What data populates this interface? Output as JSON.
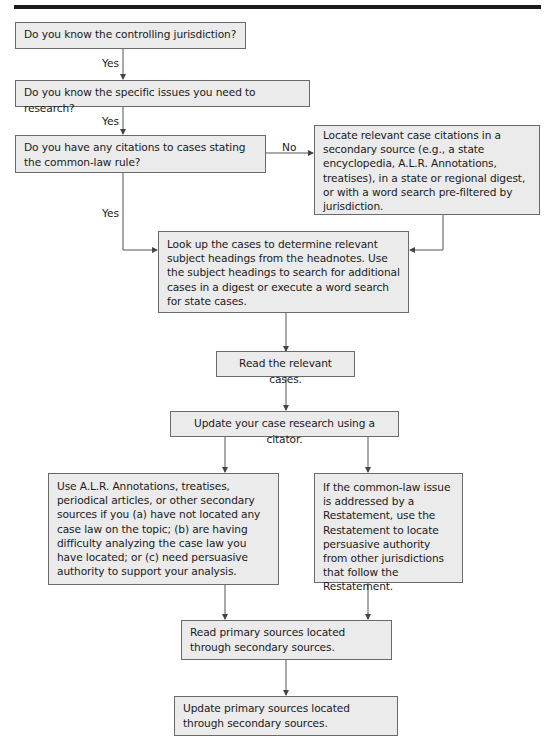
{
  "flowchart": {
    "nodes": [
      {
        "id": "q_jurisdiction",
        "text": "Do you know the controlling jurisdiction?"
      },
      {
        "id": "q_issues",
        "text": "Do you know the specific issues you need to research?"
      },
      {
        "id": "q_citations",
        "text": "Do you have any citations to cases stating the common-law rule?"
      },
      {
        "id": "locate_citations",
        "text": "Locate relevant case citations in a secondary source (e.g., a state encyclopedia, A.L.R. Annotations, treatises), in a state or regional digest, or with a word search pre-filtered by jurisdiction."
      },
      {
        "id": "look_up_cases",
        "text": "Look up the cases to determine relevant subject headings from the headnotes. Use the subject headings to search for additional cases in a digest or execute a word search for state cases."
      },
      {
        "id": "read_cases",
        "text": "Read the relevant cases."
      },
      {
        "id": "update_citator",
        "text": "Update your case research using a citator."
      },
      {
        "id": "use_secondary",
        "text": "Use A.L.R. Annotations, treatises, periodical articles, or other secondary sources if you (a) have not located any case law on the topic; (b) are having difficulty analyzing the case law you have located; or (c) need persuasive authority to support your analysis."
      },
      {
        "id": "restatement",
        "text": "If the common-law issue is addressed by a Restatement, use the Restatement to locate persuasive authority from other jurisdictions that follow the Restatement."
      },
      {
        "id": "read_primary",
        "text": "Read primary sources located through secondary sources."
      },
      {
        "id": "update_primary",
        "text": "Update primary sources located through secondary sources."
      }
    ],
    "edge_labels": {
      "yes_1": "Yes",
      "yes_2": "Yes",
      "yes_3": "Yes",
      "no_1": "No"
    },
    "colors": {
      "box_fill": "#ebebeb",
      "box_border": "#6a6a6a",
      "line": "#555555",
      "rule": "#1b1b1b"
    }
  }
}
